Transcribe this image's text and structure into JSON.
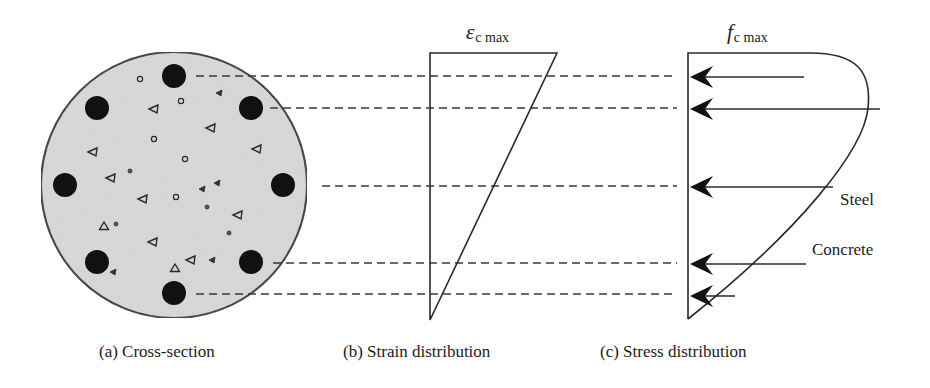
{
  "figure": {
    "captions": {
      "a": "(a) Cross-section",
      "b": "(b) Strain distribution",
      "c": "(c) Stress distribution"
    },
    "strain_label": {
      "symbol": "ε",
      "subscript": "c max"
    },
    "stress_label": {
      "symbol": "f",
      "subscript": "c max"
    },
    "annotations": {
      "steel": "Steel",
      "concrete": "Concrete"
    },
    "colors": {
      "concrete_fill": "#d9d9d9",
      "rebar": "#111111",
      "line": "#2a2a2a"
    },
    "cross_section": {
      "center": [
        174,
        185
      ],
      "radius": 133,
      "rebars": [
        {
          "x": 174,
          "y": 76
        },
        {
          "x": 251,
          "y": 108
        },
        {
          "x": 283,
          "y": 185
        },
        {
          "x": 251,
          "y": 262
        },
        {
          "x": 174,
          "y": 293
        },
        {
          "x": 97,
          "y": 262
        },
        {
          "x": 65,
          "y": 185
        },
        {
          "x": 97,
          "y": 108
        }
      ],
      "rebar_radius": 12,
      "aggregates": [
        {
          "type": "circle",
          "x": 140,
          "y": 79
        },
        {
          "type": "circle",
          "x": 181,
          "y": 101
        },
        {
          "type": "tri-small",
          "x": 219,
          "y": 93
        },
        {
          "type": "tri",
          "x": 154,
          "y": 109
        },
        {
          "type": "tri",
          "x": 211,
          "y": 128
        },
        {
          "type": "circle",
          "x": 154,
          "y": 139
        },
        {
          "type": "tri",
          "x": 257,
          "y": 149
        },
        {
          "type": "tri",
          "x": 93,
          "y": 152
        },
        {
          "type": "circle",
          "x": 185,
          "y": 159
        },
        {
          "type": "dot",
          "x": 130,
          "y": 171
        },
        {
          "type": "tri",
          "x": 111,
          "y": 178
        },
        {
          "type": "tri-small",
          "x": 217,
          "y": 183
        },
        {
          "type": "tri-small",
          "x": 202,
          "y": 189
        },
        {
          "type": "tri",
          "x": 143,
          "y": 199
        },
        {
          "type": "circle",
          "x": 176,
          "y": 197
        },
        {
          "type": "dot",
          "x": 207,
          "y": 207
        },
        {
          "type": "tri",
          "x": 238,
          "y": 215
        },
        {
          "type": "tri-up",
          "x": 104,
          "y": 226
        },
        {
          "type": "dot",
          "x": 116,
          "y": 224
        },
        {
          "type": "dot",
          "x": 229,
          "y": 233
        },
        {
          "type": "tri",
          "x": 153,
          "y": 242
        },
        {
          "type": "tri-small",
          "x": 212,
          "y": 260
        },
        {
          "type": "tri",
          "x": 191,
          "y": 260
        },
        {
          "type": "tri-up",
          "x": 175,
          "y": 268
        },
        {
          "type": "tri-small",
          "x": 113,
          "y": 272
        }
      ]
    },
    "projection_lines": [
      {
        "x1": 196,
        "y": 76,
        "x2": 677
      },
      {
        "x1": 270,
        "y": 108,
        "x2": 677
      },
      {
        "x1": 322,
        "y": 186,
        "x2": 677
      },
      {
        "x1": 273,
        "y": 263,
        "x2": 677
      },
      {
        "x1": 196,
        "y": 294,
        "x2": 677
      }
    ],
    "strain_diagram": {
      "top_left": [
        430,
        53
      ],
      "top_right": [
        557,
        53
      ],
      "bottom": [
        430,
        320
      ]
    },
    "stress_diagram": {
      "left_x": 688,
      "top_y": 53,
      "bottom_y": 319,
      "arrows": [
        {
          "y": 77,
          "x_end": 804
        },
        {
          "y": 109,
          "x_end": 880
        },
        {
          "y": 187,
          "x_end": 833
        },
        {
          "y": 264,
          "x_end": 806
        },
        {
          "y": 296,
          "x_end": 735
        }
      ]
    }
  }
}
